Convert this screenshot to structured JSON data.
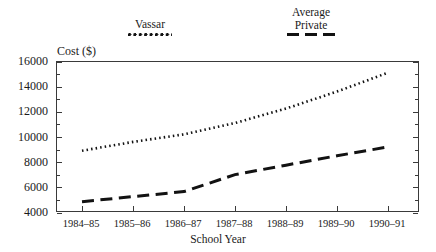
{
  "chart_data": {
    "type": "line",
    "title": "",
    "xlabel": "School Year",
    "ylabel": "Cost ($)",
    "categories": [
      "1984–85",
      "1985–86",
      "1986–87",
      "1987–88",
      "1988–89",
      "1989–90",
      "1990–91"
    ],
    "ylim": [
      4000,
      16000
    ],
    "ytick_labels": [
      "16000",
      "14000",
      "12000",
      "10000",
      "8000",
      "6000",
      "4000"
    ],
    "ytick_values": [
      16000,
      14000,
      12000,
      10000,
      8000,
      6000,
      4000
    ],
    "ytick_minor_step": 1000,
    "grid": false,
    "legend_position": "above-plot",
    "series": [
      {
        "name": "Vassar",
        "style": "dotted",
        "color": "#121212",
        "values": [
          8950,
          9650,
          10250,
          11150,
          12300,
          13650,
          15150
        ]
      },
      {
        "name": "Average\nPrivate",
        "style": "dashed",
        "color": "#121212",
        "values": [
          4900,
          5300,
          5700,
          7050,
          7800,
          8550,
          9250
        ]
      }
    ]
  },
  "legend": {
    "entries": [
      {
        "label": "Vassar",
        "swatch": "dotted-line-swatch"
      },
      {
        "label": "Average\nPrivate",
        "swatch": "dashed-line-swatch"
      }
    ]
  },
  "axes": {
    "y_title": "Cost ($)",
    "x_title": "School Year"
  }
}
